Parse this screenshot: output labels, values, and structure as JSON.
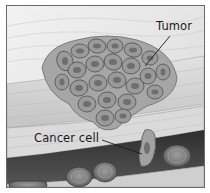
{
  "figure": {
    "style": "grayscale medical illustration",
    "labels": {
      "tumor": "Tumor",
      "cancer_cell": "Cancer cell"
    },
    "colors": {
      "background": "#ffffff",
      "tissue_light": "#e4e4e4",
      "tissue_band": "#d6d6d6",
      "tumor_cell_fill": "#9a9a9a",
      "tumor_cell_edge": "#5a5a5a",
      "vessel_lumen": "#3a3a3a",
      "red_blood_cell": "#8a8a8a",
      "frame_border": "#6a6a6a",
      "label_text": "#1a1a1a"
    }
  }
}
